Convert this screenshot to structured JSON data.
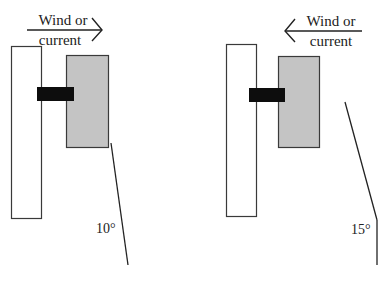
{
  "figure": {
    "colors": {
      "background": "#ffffff",
      "outline": "#3a3a3a",
      "tall_panel_fill": "#ffffff",
      "float_fill": "#c4c4c4",
      "connector_fill": "#0d0d0d",
      "line": "#222222",
      "text": "#222222"
    },
    "panels": [
      {
        "id": "left",
        "flow_label_line1": "Wind or",
        "flow_label_line2": "current",
        "flow_direction": "right",
        "arrow_icon": "arrow-right-icon",
        "angle_label": "10°",
        "angle_degrees": 10
      },
      {
        "id": "right",
        "flow_label_line1": "Wind or",
        "flow_label_line2": "current",
        "flow_direction": "left",
        "arrow_icon": "arrow-left-icon",
        "angle_label": "15°",
        "angle_degrees": 15
      }
    ]
  }
}
